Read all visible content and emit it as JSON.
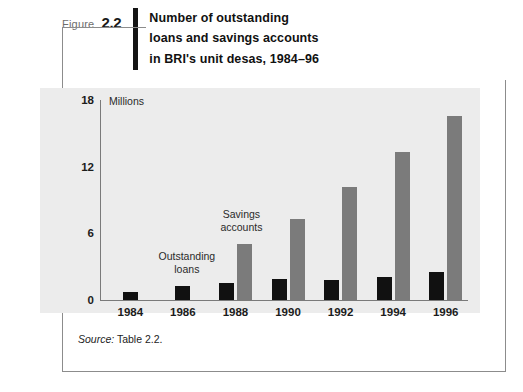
{
  "figure": {
    "label_word": "Figure",
    "number": "2.2",
    "title": "Number of outstanding\nloans and savings accounts\nin BRI's unit desas, 1984–96"
  },
  "source": {
    "prefix": "Source:",
    "text": "Table 2.2."
  },
  "chart_data": {
    "type": "bar",
    "title": "Number of outstanding loans and savings accounts in BRI's unit desas, 1984–96",
    "xlabel": "",
    "ylabel": "Millions",
    "unit_label": "Millions",
    "categories": [
      "1984",
      "1986",
      "1988",
      "1990",
      "1992",
      "1994",
      "1996"
    ],
    "series": [
      {
        "name": "Outstanding loans",
        "color": "#111111",
        "values": [
          0.7,
          1.3,
          1.5,
          1.9,
          1.8,
          2.1,
          2.5
        ]
      },
      {
        "name": "Savings accounts",
        "color": "#7b7b7b",
        "values": [
          0,
          0,
          5.0,
          7.3,
          10.2,
          13.3,
          16.6
        ]
      }
    ],
    "yticks": [
      0,
      6,
      12,
      18
    ],
    "ylim": [
      0,
      18
    ],
    "grid": false,
    "legend_position": "inline-annotations",
    "annotations": [
      {
        "text": "Outstanding\nloans",
        "target": "1986"
      },
      {
        "text": "Savings\naccounts",
        "target": "1988"
      }
    ]
  }
}
